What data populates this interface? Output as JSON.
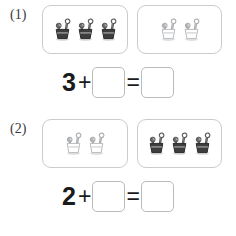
{
  "page": {
    "type": "math-worksheet",
    "background_color": "#ffffff",
    "box_border_color": "#c9cbcd",
    "text_color": "#1b1b1b",
    "clip_dark_color": "#3a3a3a",
    "clip_light_color": "#c0c2c4"
  },
  "problems": [
    {
      "label": "(1)",
      "groups": [
        {
          "name": "dark-clip-group",
          "count": 3,
          "style": "dark",
          "icon": "binder-clip-icon"
        },
        {
          "name": "light-clip-group",
          "count": 2,
          "style": "light",
          "icon": "binder-clip-icon"
        }
      ],
      "equation": {
        "first_operand": "3",
        "operator": "+",
        "second_operand": "",
        "equals": "=",
        "result": ""
      }
    },
    {
      "label": "(2)",
      "groups": [
        {
          "name": "light-clip-group",
          "count": 2,
          "style": "light",
          "icon": "binder-clip-icon"
        },
        {
          "name": "dark-clip-group",
          "count": 3,
          "style": "dark",
          "icon": "binder-clip-icon"
        }
      ],
      "equation": {
        "first_operand": "2",
        "operator": "+",
        "second_operand": "",
        "equals": "=",
        "result": ""
      }
    }
  ]
}
